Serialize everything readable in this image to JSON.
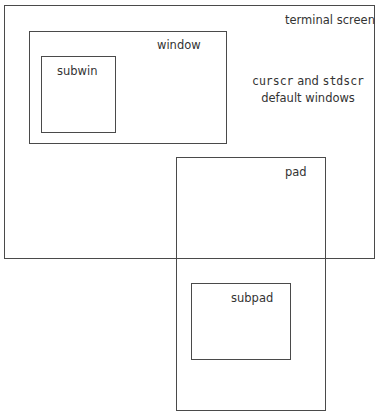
{
  "diagram": {
    "terminal": {
      "label": "terminal screen"
    },
    "window": {
      "label": "window"
    },
    "subwin": {
      "label": "subwin"
    },
    "note": {
      "line1_a": "curscr",
      "line1_b": " and ",
      "line1_c": "stdscr",
      "line2": "default windows"
    },
    "pad": {
      "label": "pad"
    },
    "subpad": {
      "label": "subpad"
    }
  }
}
